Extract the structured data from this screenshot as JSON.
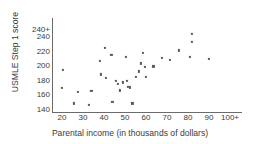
{
  "chart_data": {
    "type": "scatter",
    "title": "",
    "xlabel": "Parental income (in thousands of dollars)",
    "ylabel": "USMLE Step 1 score",
    "xlim": [
      15,
      103
    ],
    "ylim": [
      135,
      250
    ],
    "grid": false,
    "legend": null,
    "point_color": "#59595e",
    "axis_color": "#6b6b6b",
    "xticks": [
      {
        "value": 20,
        "label": "20"
      },
      {
        "value": 30,
        "label": "30"
      },
      {
        "value": 40,
        "label": "40"
      },
      {
        "value": 50,
        "label": "50"
      },
      {
        "value": 60,
        "label": "60"
      },
      {
        "value": 70,
        "label": "70"
      },
      {
        "value": 80,
        "label": "80"
      },
      {
        "value": 90,
        "label": "90"
      },
      {
        "value": 100,
        "label": "100+"
      }
    ],
    "yticks": [
      {
        "value": 140,
        "label": "140"
      },
      {
        "value": 160,
        "label": "160"
      },
      {
        "value": 180,
        "label": "180"
      },
      {
        "value": 200,
        "label": "200"
      },
      {
        "value": 220,
        "label": "220"
      },
      {
        "value": 240,
        "label": "240"
      },
      {
        "value": 250,
        "label": "240+"
      }
    ],
    "points": [
      {
        "x": 20.5,
        "y": 195
      },
      {
        "x": 20.0,
        "y": 170
      },
      {
        "x": 25.5,
        "y": 149
      },
      {
        "x": 27.5,
        "y": 165
      },
      {
        "x": 33.0,
        "y": 147
      },
      {
        "x": 34.0,
        "y": 166
      },
      {
        "x": 38.0,
        "y": 208
      },
      {
        "x": 38.5,
        "y": 189
      },
      {
        "x": 40.5,
        "y": 225
      },
      {
        "x": 41.0,
        "y": 184
      },
      {
        "x": 43.5,
        "y": 216
      },
      {
        "x": 44.0,
        "y": 151
      },
      {
        "x": 45.5,
        "y": 180
      },
      {
        "x": 46.5,
        "y": 176
      },
      {
        "x": 47.5,
        "y": 167
      },
      {
        "x": 49.0,
        "y": 178
      },
      {
        "x": 50.5,
        "y": 213
      },
      {
        "x": 51.0,
        "y": 180
      },
      {
        "x": 51.5,
        "y": 172
      },
      {
        "x": 52.5,
        "y": 171
      },
      {
        "x": 53.5,
        "y": 149
      },
      {
        "x": 55.0,
        "y": 186
      },
      {
        "x": 56.5,
        "y": 193
      },
      {
        "x": 57.5,
        "y": 204
      },
      {
        "x": 58.5,
        "y": 219
      },
      {
        "x": 59.5,
        "y": 199
      },
      {
        "x": 60.0,
        "y": 186
      },
      {
        "x": 63.5,
        "y": 200
      },
      {
        "x": 67.5,
        "y": 212
      },
      {
        "x": 71.5,
        "y": 209
      },
      {
        "x": 75.5,
        "y": 222
      },
      {
        "x": 81.0,
        "y": 213
      },
      {
        "x": 82.0,
        "y": 245
      },
      {
        "x": 82.0,
        "y": 234
      },
      {
        "x": 90.0,
        "y": 210
      }
    ]
  }
}
